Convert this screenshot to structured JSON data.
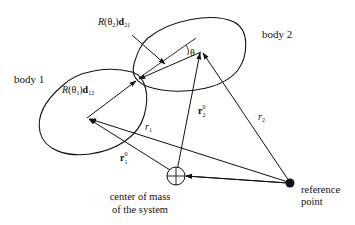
{
  "diagram": {
    "type": "two-body kinematics diagram",
    "labels": {
      "body1": "body 1",
      "body2": "body 2",
      "R_theta2_d21": {
        "R": "R",
        "theta": "(θ",
        "theta_sub": "2",
        "close": ")",
        "d": "d",
        "d_sub": "21"
      },
      "R_theta1_d12": {
        "R": "R",
        "theta": "(θ",
        "theta_sub": "1",
        "close": ")",
        "d": "d",
        "d_sub": "12"
      },
      "theta": "θ",
      "r1": {
        "r": "r",
        "sub": "1"
      },
      "r2": {
        "r": "r",
        "sub": "2"
      },
      "r1_0": {
        "r": "r",
        "sub": "1",
        "sup": "0"
      },
      "r2_0": {
        "r": "r",
        "sub": "2",
        "sup": "0"
      },
      "com_line1": "center of mass",
      "com_line2": "of the system",
      "ref_line1": "reference",
      "ref_line2": "point"
    },
    "points": {
      "body1_center": [
        87,
        118
      ],
      "body2_center": [
        201,
        50
      ],
      "contact": [
        137,
        80
      ],
      "center_of_mass": [
        176,
        176
      ],
      "reference_point": [
        290,
        183
      ]
    },
    "colors": {
      "stroke": "#111111",
      "background": "#ffffff"
    }
  }
}
